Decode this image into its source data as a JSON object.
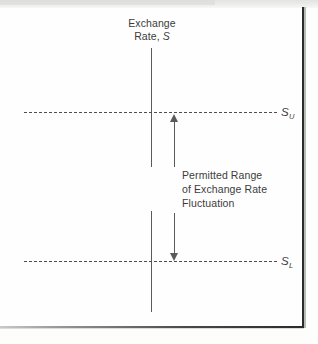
{
  "figure": {
    "type": "line-diagram",
    "background_color": "#fefefe",
    "ink_color": "#3c3c3c"
  },
  "axis": {
    "title_line1": "Exchange",
    "title_line2_prefix": "Rate, ",
    "title_line2_symbol": "S",
    "orientation": "vertical"
  },
  "annotation": {
    "line1": "Permitted Range",
    "line2": "of Exchange Rate",
    "line3": "Fluctuation"
  },
  "bounds": {
    "upper": {
      "symbol": "S",
      "subscript": "U",
      "style": "dashed"
    },
    "lower": {
      "symbol": "S",
      "subscript": "L",
      "style": "dashed"
    }
  },
  "chart_data": {
    "type": "line",
    "title": "Exchange Rate, S",
    "xlabel": "",
    "ylabel": "Exchange Rate, S",
    "grid": false,
    "legend": "none",
    "annotations": [
      "Permitted Range of Exchange Rate Fluctuation"
    ],
    "reference_lines": [
      {
        "label": "S_U",
        "role": "upper band limit",
        "style": "dashed",
        "y": 1
      },
      {
        "label": "S_L",
        "role": "lower band limit",
        "style": "dashed",
        "y": 0
      }
    ],
    "markers": [
      {
        "label": "double-headed arrow",
        "role": "permitted range span",
        "from": "S_L",
        "to": "S_U"
      }
    ]
  }
}
